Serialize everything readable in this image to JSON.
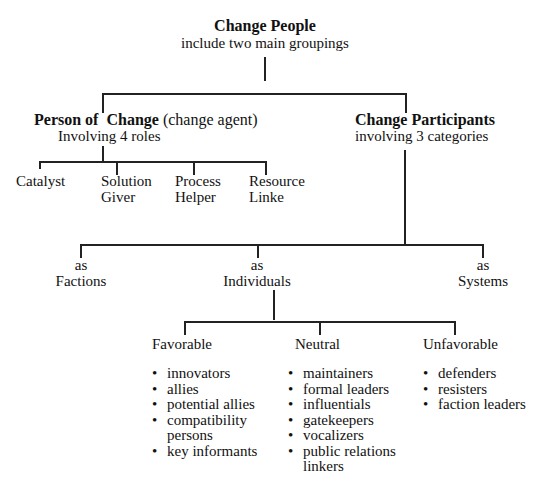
{
  "root": {
    "title": "Change People",
    "subtitle": "include two main groupings"
  },
  "left": {
    "title_bold_1": "Person of",
    "title_bold_2": "Change",
    "title_normal": "(change agent)",
    "subtitle": "Involving 4 roles",
    "roles": [
      {
        "line1": "Catalyst",
        "line2": ""
      },
      {
        "line1": "Solution",
        "line2": "Giver"
      },
      {
        "line1": "Process",
        "line2": "Helper"
      },
      {
        "line1": "Resource",
        "line2": "Linke"
      }
    ]
  },
  "right": {
    "title": "Change Participants",
    "subtitle": "involving 3 categories",
    "categories": [
      {
        "line1": "as",
        "line2": "Factions"
      },
      {
        "line1": "as",
        "line2": "Individuals"
      },
      {
        "line1": "as",
        "line2": "Systems"
      }
    ]
  },
  "individuals": {
    "groups": [
      {
        "label": "Favorable",
        "items": [
          "innovators",
          "allies",
          "potential allies",
          "compatibility persons",
          "key informants"
        ]
      },
      {
        "label": "Neutral",
        "items": [
          "maintainers",
          "formal leaders",
          "influentials",
          "gatekeepers",
          "vocalizers",
          "public relations linkers"
        ]
      },
      {
        "label": "Unfavorable",
        "items": [
          "defenders",
          "resisters",
          "faction leaders"
        ]
      }
    ]
  }
}
